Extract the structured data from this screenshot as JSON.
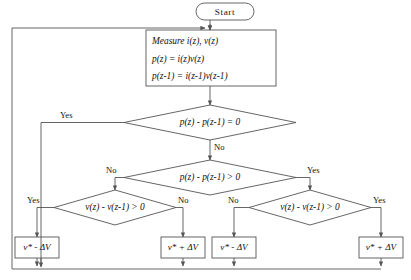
{
  "diagram": {
    "type": "flowchart",
    "stroke_color": "#555555",
    "text_color": "#111111",
    "background": "#ffffff"
  },
  "nodes": {
    "start": {
      "label": "Start",
      "shape": "terminator"
    },
    "measure": {
      "shape": "process",
      "lines": [
        "Measure i(z), v(z)",
        "p(z) = i(z)v(z)",
        "p(z-1) = i(z-1)v(z-1)"
      ]
    },
    "decision1": {
      "shape": "decision",
      "label": "p(z) - p(z-1) = 0"
    },
    "decision2": {
      "shape": "decision",
      "label": "p(z) - p(z-1) > 0"
    },
    "decision3_left": {
      "shape": "decision",
      "label": "v(z) - v(z-1) > 0"
    },
    "decision3_right": {
      "shape": "decision",
      "label": "v(z) - v(z-1) > 0"
    },
    "out1": {
      "shape": "process",
      "label": "v* - ΔV"
    },
    "out2": {
      "shape": "process",
      "label": "v* + ΔV"
    },
    "out3": {
      "shape": "process",
      "label": "v* - ΔV"
    },
    "out4": {
      "shape": "process",
      "label": "v* + ΔV"
    }
  },
  "edge_labels": {
    "d1_yes": "Yes",
    "d1_no": "No",
    "d2_no": "No",
    "d2_yes": "Yes",
    "d3l_yes": "Yes",
    "d3l_no": "No",
    "d3r_no": "No",
    "d3r_yes": "Yes"
  }
}
